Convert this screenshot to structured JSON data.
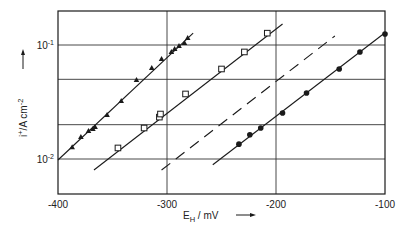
{
  "chart_data": {
    "type": "line",
    "title": "",
    "xlabel": "E_H / mV",
    "ylabel": "i+ / A cm^-2",
    "xscale": "linear",
    "yscale": "log",
    "xlim": [
      -400,
      -100
    ],
    "ylim": [
      0.0049,
      0.2
    ],
    "grid": true,
    "x_ticks": [
      -400,
      -300,
      -200,
      -100
    ],
    "x_tick_labels": [
      "-400",
      "-300",
      "-200",
      "-100"
    ],
    "y_gridlines": [
      0.01,
      0.02,
      0.05,
      0.1
    ],
    "y_tick_labels": [
      {
        "value": 0.1,
        "base": "10",
        "exp": "-1"
      },
      {
        "value": 0.01,
        "base": "10",
        "exp": "-2"
      }
    ],
    "legend": null,
    "series": [
      {
        "name": "triangles",
        "marker": "filled-triangle",
        "line_style": "solid",
        "fit_line": {
          "x": [
            -400,
            -276
          ],
          "y": [
            0.0098,
            0.127
          ]
        },
        "x": [
          -387,
          -379,
          -372,
          -368,
          -366,
          -355,
          -342,
          -328,
          -314,
          -305,
          -296,
          -293,
          -289,
          -284,
          -281
        ],
        "y": [
          0.0127,
          0.0156,
          0.0176,
          0.0183,
          0.0191,
          0.0243,
          0.0323,
          0.0493,
          0.0628,
          0.0753,
          0.0869,
          0.0923,
          0.098,
          0.104,
          0.115
        ]
      },
      {
        "name": "open-squares",
        "marker": "open-square",
        "line_style": "solid",
        "fit_line": {
          "x": [
            -367,
            -194
          ],
          "y": [
            0.008,
            0.153
          ]
        },
        "x": [
          -345,
          -321,
          -307,
          -306,
          -283,
          -250,
          -229,
          -208
        ],
        "y": [
          0.0125,
          0.0187,
          0.0233,
          0.0248,
          0.0372,
          0.0616,
          0.0869,
          0.127
        ]
      },
      {
        "name": "dashed-reference",
        "marker": "none",
        "line_style": "dashed",
        "fit_line": {
          "x": [
            -305,
            -146
          ],
          "y": [
            0.008,
            0.12
          ]
        },
        "x": [],
        "y": []
      },
      {
        "name": "filled-circles",
        "marker": "filled-circle",
        "line_style": "solid",
        "fit_line": {
          "x": [
            -258,
            -100
          ],
          "y": [
            0.0089,
            0.128
          ]
        },
        "x": [
          -234,
          -224,
          -214,
          -194,
          -172,
          -142,
          -123,
          -100
        ],
        "y": [
          0.0135,
          0.0163,
          0.0187,
          0.0253,
          0.0379,
          0.0616,
          0.0869,
          0.125
        ]
      }
    ]
  },
  "axes": {
    "x_label_main": "E",
    "x_label_sub": "H",
    "x_label_rest": " / mV",
    "y_label_main": "i",
    "y_label_sup": "+",
    "y_label_rest": "/A  cm",
    "y_label_exp": "-2"
  },
  "colors": {
    "ink": "#1a1a1a",
    "grid": "#333333",
    "background": "#ffffff"
  }
}
